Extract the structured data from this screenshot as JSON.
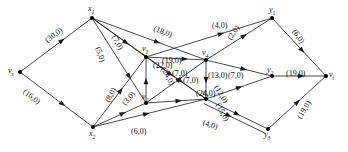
{
  "figure": {
    "name": "network-flow-graph",
    "width": 348,
    "height": 152,
    "background_color": "#ffffff",
    "line_color": "#1a1a1a",
    "node_color": "#000000"
  },
  "nodes": [
    {
      "id": "vs",
      "label": "v",
      "sub": "s",
      "x": 20,
      "y": 72,
      "label_dx": -12,
      "label_dy": -5
    },
    {
      "id": "x1",
      "label": "x",
      "sub": "1",
      "x": 92,
      "y": 18,
      "label_dx": -4,
      "label_dy": -13
    },
    {
      "id": "x2",
      "label": "x",
      "sub": "2",
      "x": 93,
      "y": 127,
      "label_dx": -4,
      "label_dy": 3
    },
    {
      "id": "v1",
      "label": "v",
      "sub": "1",
      "x": 146,
      "y": 57,
      "label_dx": -4,
      "label_dy": -12
    },
    {
      "id": "v2",
      "label": "v",
      "sub": "2",
      "x": 146,
      "y": 103,
      "label_dx": -4,
      "label_dy": -10
    },
    {
      "id": "v3",
      "label": "v",
      "sub": "3",
      "x": 206,
      "y": 99,
      "label_dx": -4,
      "label_dy": -10
    },
    {
      "id": "v4",
      "label": "v",
      "sub": "4",
      "x": 206,
      "y": 60,
      "label_dx": -4,
      "label_dy": -11
    },
    {
      "id": "y1",
      "label": "y",
      "sub": "1",
      "x": 272,
      "y": 18,
      "label_dx": -3,
      "label_dy": -12
    },
    {
      "id": "y2",
      "label": "y",
      "sub": "2",
      "x": 272,
      "y": 76,
      "label_dx": -5,
      "label_dy": -10
    },
    {
      "id": "y3",
      "label": "y",
      "sub": "3",
      "x": 268,
      "y": 129,
      "label_dx": -4,
      "label_dy": 2
    },
    {
      "id": "vt",
      "label": "v",
      "sub": "t",
      "x": 326,
      "y": 76,
      "label_dx": 3,
      "label_dy": -5
    }
  ],
  "edges": [
    {
      "from": "vs",
      "to": "x1",
      "capacity": 30,
      "flow": 0,
      "label": "(30,0)",
      "label_x": 44,
      "label_y": 38,
      "rotate": -37,
      "arrow_t": 0.62
    },
    {
      "from": "vs",
      "to": "x2",
      "capacity": 16,
      "flow": 0,
      "label": "(16,0)",
      "label_x": 26,
      "label_y": 88,
      "rotate": 37,
      "arrow_t": 0.62
    },
    {
      "from": "x1",
      "to": "v1",
      "capacity": 7,
      "flow": 0,
      "label": "(7,0)",
      "label_x": 117,
      "label_y": 34,
      "rotate": 62,
      "arrow_t": 0.68
    },
    {
      "from": "x1",
      "to": "v4",
      "capacity": 18,
      "flow": 0,
      "label": "(18,0)",
      "label_x": 155,
      "label_y": 25,
      "rotate": 20,
      "arrow_t": 0.6
    },
    {
      "from": "x1",
      "to": "v2",
      "capacity": 5,
      "flow": 0,
      "label": "(5,0)",
      "label_x": 101,
      "label_y": 46,
      "rotate": 70,
      "arrow_t": 0.72
    },
    {
      "from": "x1",
      "to": "v3",
      "capacity": 22,
      "flow": 0,
      "label": "(22,0)",
      "label_x": 153,
      "label_y": 62,
      "rotate": 0,
      "arrow_t": 0.8
    },
    {
      "from": "x2",
      "to": "v1",
      "capacity": 8,
      "flow": 0,
      "label": "(8,0)",
      "label_x": 104,
      "label_y": 100,
      "rotate": -62,
      "arrow_t": 0.56
    },
    {
      "from": "x2",
      "to": "v2",
      "capacity": 3,
      "flow": 0,
      "label": "(3,0)",
      "label_x": 121,
      "label_y": 102,
      "rotate": -50,
      "arrow_t": 0.62
    },
    {
      "from": "x2",
      "to": "v3",
      "capacity": 6,
      "flow": 0,
      "label": "(6,0)",
      "label_x": 131,
      "label_y": 128,
      "rotate": 0,
      "arrow_t": 0.5
    },
    {
      "from": "v1",
      "to": "y1",
      "capacity": 4,
      "flow": 0,
      "label": "(4,0)",
      "label_x": 212,
      "label_y": 22,
      "rotate": 0,
      "arrow_t": 0.62
    },
    {
      "from": "v1",
      "to": "v4",
      "capacity": 19,
      "flow": 0,
      "label": "(19,0)",
      "label_x": 162,
      "label_y": 57,
      "rotate": 0,
      "arrow_t": 0.7
    },
    {
      "from": "v1",
      "to": "v3",
      "capacity": 24,
      "flow": 0,
      "label": "(24,0)",
      "label_x": 166,
      "label_y": 66,
      "rotate": 60,
      "arrow_t": 0.45
    },
    {
      "from": "v2",
      "to": "v1",
      "capacity": 24,
      "flow": 0,
      "label": "(24,0)",
      "label_x": 196,
      "label_y": 90,
      "rotate": 0,
      "arrow_t": 0.55
    },
    {
      "from": "v2",
      "to": "v4",
      "capacity": 7,
      "flow": 0,
      "label": "(7,0)",
      "label_x": 172,
      "label_y": 70,
      "rotate": 0,
      "arrow_t": 0.6
    },
    {
      "from": "v2",
      "to": "v3",
      "capacity": 7,
      "flow": 0,
      "label": "(7,0)",
      "label_x": 183,
      "label_y": 77,
      "rotate": 0,
      "arrow_t": 0.6
    },
    {
      "from": "v4",
      "to": "y1",
      "capacity": 2,
      "flow": 0,
      "label": "(2,0)",
      "label_x": 226,
      "label_y": 37,
      "rotate": -55,
      "arrow_t": 0.62
    },
    {
      "from": "v4",
      "to": "y2",
      "capacity": 13,
      "flow": 0,
      "label": "(13,0)",
      "label_x": 208,
      "label_y": 72,
      "rotate": 0,
      "arrow_t": 0.62
    },
    {
      "from": "v4",
      "to": "v3",
      "capacity": 7,
      "flow": 0,
      "label": "(7,0)",
      "label_x": 228,
      "label_y": 72,
      "rotate": 0,
      "arrow_t": 0.6
    },
    {
      "from": "v3",
      "to": "y2",
      "capacity": 12,
      "flow": 0,
      "label": "(12,0)",
      "label_x": 219,
      "label_y": 84,
      "rotate": 58,
      "arrow_t": 0.55
    },
    {
      "from": "v3",
      "to": "y3",
      "capacity": 15,
      "flow": 0,
      "label": "(15,0)",
      "label_x": 221,
      "label_y": 102,
      "rotate": 62,
      "arrow_t": 0.55
    },
    {
      "from": "v3",
      "to": "y3",
      "capacity": 4,
      "flow": 0,
      "label": "(4,0)",
      "label_x": 204,
      "label_y": 119,
      "rotate": 18,
      "arrow_t": 0.45
    },
    {
      "from": "y1",
      "to": "vt",
      "capacity": 6,
      "flow": 0,
      "label": "(6,0)",
      "label_x": 297,
      "label_y": 28,
      "rotate": 55,
      "arrow_t": 0.6
    },
    {
      "from": "y2",
      "to": "vt",
      "capacity": 19,
      "flow": 0,
      "label": "(19,0)",
      "label_x": 286,
      "label_y": 70,
      "rotate": 0,
      "arrow_t": 0.6
    },
    {
      "from": "y3",
      "to": "vt",
      "capacity": 19,
      "flow": 0,
      "label": "(19,0)",
      "label_x": 296,
      "label_y": 116,
      "rotate": -58,
      "arrow_t": 0.55
    }
  ]
}
